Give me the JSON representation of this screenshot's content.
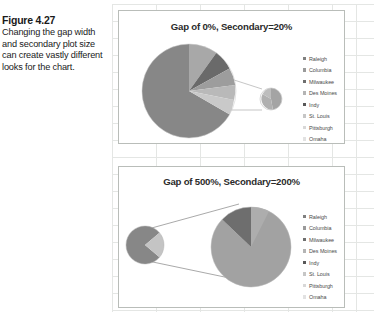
{
  "caption": {
    "figure_label": "Figure 4.27",
    "text": "Changing the gap width and secondary plot size can create vastly different looks for the chart."
  },
  "charts": [
    {
      "id": "top",
      "title": "Gap of 0%, Secondary=20%",
      "legend": [
        {
          "label": "Raleigh",
          "color": "#808080"
        },
        {
          "label": "Columbia",
          "color": "#9a9a9a"
        },
        {
          "label": "Milwaukee",
          "color": "#6e6e6e"
        },
        {
          "label": "Des Moines",
          "color": "#b4b4b4"
        },
        {
          "label": "Indy",
          "color": "#585858"
        },
        {
          "label": "St. Louis",
          "color": "#c6c6c6"
        },
        {
          "label": "Pittsburgh",
          "color": "#d8d8d8"
        },
        {
          "label": "Omaha",
          "color": "#e2e2e2"
        }
      ]
    },
    {
      "id": "bottom",
      "title": "Gap of 500%, Secondary=200%",
      "legend": [
        {
          "label": "Raleigh",
          "color": "#808080"
        },
        {
          "label": "Columbia",
          "color": "#9a9a9a"
        },
        {
          "label": "Milwaukee",
          "color": "#6e6e6e"
        },
        {
          "label": "Des Moines",
          "color": "#b4b4b4"
        },
        {
          "label": "Indy",
          "color": "#585858"
        },
        {
          "label": "St. Louis",
          "color": "#c6c6c6"
        },
        {
          "label": "Pittsburgh",
          "color": "#d8d8d8"
        },
        {
          "label": "Omaha",
          "color": "#e2e2e2"
        }
      ]
    }
  ],
  "chart_data": [
    {
      "type": "pie",
      "title": "Gap of 0%, Secondary=20%",
      "subtype": "pie-of-pie",
      "categories": [
        "Raleigh",
        "Columbia",
        "Milwaukee",
        "Des Moines",
        "Indy",
        "St. Louis",
        "Pittsburgh",
        "Omaha"
      ],
      "values": [
        30,
        12,
        8,
        6,
        38,
        3,
        2,
        1
      ],
      "legend_position": "right",
      "grid": false,
      "primary_plot": {
        "center": [
          70,
          78
        ],
        "radius": 48,
        "slices": [
          {
            "label": "Raleigh",
            "value": 30,
            "start_deg": 0,
            "end_deg": 72,
            "color": "#9a9a9a"
          },
          {
            "label": "Columbia",
            "value": 12,
            "start_deg": 72,
            "end_deg": 100,
            "color": "#6e6e6e"
          },
          {
            "label": "Milwaukee",
            "value": 8,
            "start_deg": 100,
            "end_deg": 120,
            "color": "#b4b4b4"
          },
          {
            "label": "Des Moines",
            "value": 6,
            "start_deg": 120,
            "end_deg": 135,
            "color": "#9a9a9a"
          },
          {
            "label": "Other",
            "value": 6,
            "start_deg": 135,
            "end_deg": 150,
            "color": "#c6c6c6"
          },
          {
            "label": "Indy",
            "value": 38,
            "start_deg": 150,
            "end_deg": 360,
            "color": "#808080"
          }
        ]
      },
      "secondary_plot": {
        "center": [
          152,
          88
        ],
        "radius": 11,
        "size_percent": 20,
        "gap_percent": 0,
        "slices": [
          {
            "label": "St. Louis",
            "value": 3,
            "start_deg": 0,
            "end_deg": 170,
            "color": "#b4b4b4"
          },
          {
            "label": "Pittsburgh",
            "value": 2,
            "start_deg": 170,
            "end_deg": 280,
            "color": "#a6a6a6"
          },
          {
            "label": "Omaha",
            "value": 1,
            "start_deg": 280,
            "end_deg": 360,
            "color": "#c2c2c2"
          }
        ]
      }
    },
    {
      "type": "pie",
      "title": "Gap of 500%, Secondary=200%",
      "subtype": "pie-of-pie",
      "categories": [
        "Raleigh",
        "Columbia",
        "Milwaukee",
        "Des Moines",
        "Indy",
        "St. Louis",
        "Pittsburgh",
        "Omaha"
      ],
      "values": [
        30,
        12,
        8,
        6,
        38,
        3,
        2,
        1
      ],
      "legend_position": "right",
      "grid": false,
      "primary_plot": {
        "center": [
          26,
          78
        ],
        "radius": 19,
        "slices": [
          {
            "label": "Main",
            "value": 60,
            "start_deg": 130,
            "end_deg": 410,
            "color": "#808080"
          },
          {
            "label": "Other",
            "value": 40,
            "start_deg": 50,
            "end_deg": 130,
            "color": "#c2c2c2"
          }
        ]
      },
      "secondary_plot": {
        "center": [
          132,
          82
        ],
        "radius": 40,
        "size_percent": 200,
        "gap_percent": 500,
        "slices": [
          {
            "label": "St. Louis",
            "value": 3,
            "start_deg": 0,
            "end_deg": 72,
            "color": "#9a9a9a"
          },
          {
            "label": "Pittsburgh",
            "value": 2,
            "start_deg": 72,
            "end_deg": 300,
            "color": "#a0a0a0"
          },
          {
            "label": "Omaha",
            "value": 1,
            "start_deg": 300,
            "end_deg": 360,
            "color": "#6e6e6e"
          }
        ]
      },
      "connector_lines": 2
    }
  ]
}
